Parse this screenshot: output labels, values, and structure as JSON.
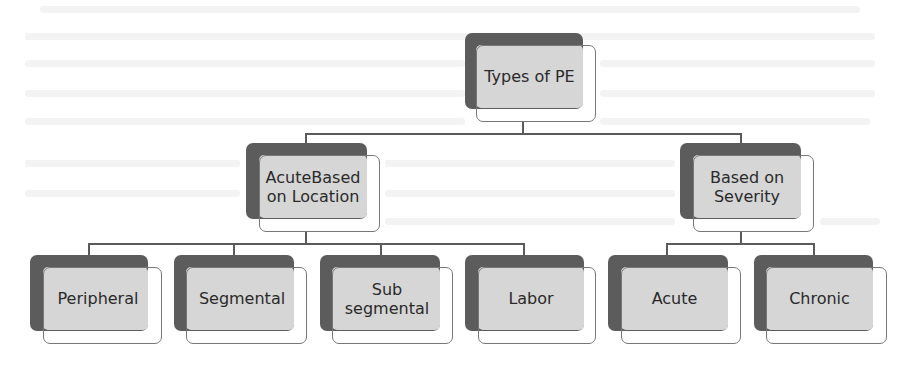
{
  "diagram": {
    "type": "hierarchy",
    "colors": {
      "shadow": "#5c5c5c",
      "fill": "#d6d6d6",
      "outline": "#777777",
      "connector": "#5a5a5a",
      "text": "#2a2a2a"
    },
    "root": {
      "label": "Types of PE"
    },
    "categories": [
      {
        "label": "AcuteBased on Location",
        "label_lines": [
          "AcuteBased",
          "on Location"
        ],
        "children": [
          {
            "label": "Peripheral"
          },
          {
            "label": "Segmental"
          },
          {
            "label": "Sub segmental",
            "label_lines": [
              "Sub",
              "segmental"
            ]
          },
          {
            "label": "Labor"
          }
        ]
      },
      {
        "label": "Based on Severity",
        "label_lines": [
          "Based on",
          "Severity"
        ],
        "children": [
          {
            "label": "Acute"
          },
          {
            "label": "Chronic"
          }
        ]
      }
    ]
  }
}
